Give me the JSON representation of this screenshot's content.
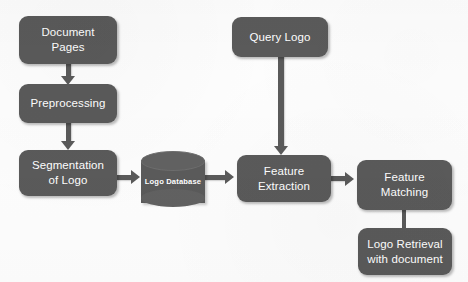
{
  "diagram": {
    "background_color": "#fdfdfd",
    "node_fill_color": "#5a5a5a",
    "node_text_color": "#ffffff",
    "arrow_color": "#5a5a5a",
    "nodes": [
      {
        "id": "document-pages",
        "shape": "rounded-rect",
        "line1": "Document",
        "line2": "Pages"
      },
      {
        "id": "preprocessing",
        "shape": "rounded-rect",
        "line1": "Preprocessing",
        "line2": ""
      },
      {
        "id": "segmentation",
        "shape": "rounded-rect",
        "line1": "Segmentation",
        "line2": "of Logo"
      },
      {
        "id": "logo-database",
        "shape": "cylinder",
        "line1": "Logo Database",
        "line2": ""
      },
      {
        "id": "query-logo",
        "shape": "rounded-rect",
        "line1": "Query Logo",
        "line2": ""
      },
      {
        "id": "feature-extraction",
        "shape": "rounded-rect",
        "line1": "Feature",
        "line2": "Extraction"
      },
      {
        "id": "feature-matching",
        "shape": "rounded-rect",
        "line1": "Feature",
        "line2": "Matching"
      },
      {
        "id": "logo-retrieval",
        "shape": "rounded-rect",
        "line1": "Logo Retrieval",
        "line2": "with document"
      }
    ],
    "edges": [
      {
        "id": "edge-document-pages-to-preprocessing",
        "from": "document-pages",
        "to": "preprocessing",
        "direction": "down",
        "arrowhead": true
      },
      {
        "id": "edge-preprocessing-to-segmentation",
        "from": "preprocessing",
        "to": "segmentation",
        "direction": "down",
        "arrowhead": true
      },
      {
        "id": "edge-segmentation-to-logo-database",
        "from": "segmentation",
        "to": "logo-database",
        "direction": "right",
        "arrowhead": true
      },
      {
        "id": "edge-logo-database-to-feature-extraction",
        "from": "logo-database",
        "to": "feature-extraction",
        "direction": "right",
        "arrowhead": true
      },
      {
        "id": "edge-query-logo-to-feature-extraction",
        "from": "query-logo",
        "to": "feature-extraction",
        "direction": "down",
        "arrowhead": true
      },
      {
        "id": "edge-feature-extraction-to-feature-matching",
        "from": "feature-extraction",
        "to": "feature-matching",
        "direction": "right",
        "arrowhead": true
      },
      {
        "id": "edge-feature-matching-to-logo-retrieval",
        "from": "feature-matching",
        "to": "logo-retrieval",
        "direction": "down",
        "arrowhead": false
      }
    ]
  }
}
